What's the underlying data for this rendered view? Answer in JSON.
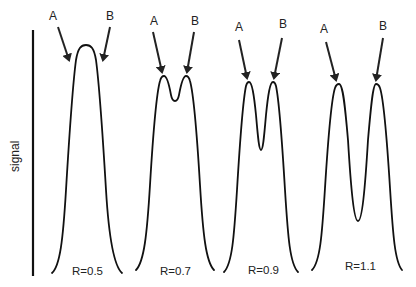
{
  "diagram": {
    "y_axis_label": "signal",
    "panels": [
      {
        "resolution_label": "R=0.5",
        "peak_a_label": "A",
        "peak_b_label": "B",
        "description": "peaks fully merged into single maximum"
      },
      {
        "resolution_label": "R=0.7",
        "peak_a_label": "A",
        "peak_b_label": "B",
        "description": "two peaks with shallow valley"
      },
      {
        "resolution_label": "R=0.9",
        "peak_a_label": "A",
        "peak_b_label": "B",
        "description": "two peaks with deeper valley"
      },
      {
        "resolution_label": "R=1.1",
        "peak_a_label": "A",
        "peak_b_label": "B",
        "description": "two peaks nearly baseline-resolved"
      }
    ],
    "colors": {
      "line": "#111111",
      "background": "#ffffff"
    }
  }
}
